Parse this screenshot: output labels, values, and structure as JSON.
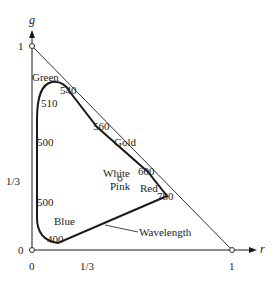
{
  "axes": {
    "x_label": "r",
    "y_label": "g",
    "x_ticks": [
      "0",
      "1/3",
      "1"
    ],
    "y_ticks": [
      "0",
      "1/3",
      "1"
    ]
  },
  "region_labels": {
    "green": "Green",
    "gold": "Gold",
    "white": "White",
    "pink": "Pink",
    "red": "Red",
    "blue": "Blue"
  },
  "wavelength_labels": {
    "w540": "540",
    "w510": "510",
    "w500a": "500",
    "w560": "560",
    "w600": "600",
    "w500b": "500",
    "w780": "780",
    "w400": "400"
  },
  "annotation": {
    "wavelength": "Wavelength"
  },
  "colors": {
    "line": "#1a1a1a",
    "text": "#222222",
    "background": "#ffffff"
  }
}
